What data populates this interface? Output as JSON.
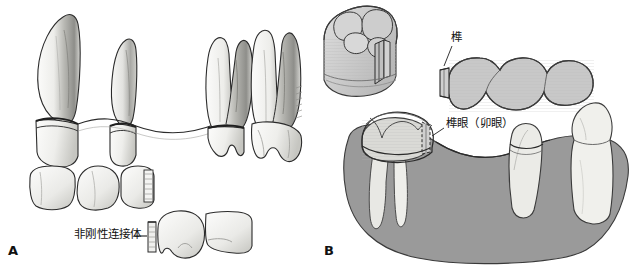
{
  "figure": {
    "background_color": "#ffffff",
    "width": 637,
    "height": 268
  },
  "colors": {
    "outline": "#2b2b2b",
    "tooth_light": "#f2f2ef",
    "tooth_mid": "#d8d8d4",
    "tooth_shade": "#b4b4b0",
    "crown_fill": "#c8c8c8",
    "mandible_gray": "#9a9a9a",
    "mandible_dark": "#8b8b8b",
    "hatch": "#a8a8a8",
    "label_text": "#111111"
  },
  "panel_a": {
    "letter": "A",
    "label_nonrigid": "非刚性连接体",
    "leader_dash": "—",
    "description": "Lateral view of prepared abutment teeth with a fixed partial denture, plus occlusal views of the retainers showing the non-rigid connector keyway",
    "teeth_lateral": [
      {
        "name": "canine-abutment",
        "root_type": "single",
        "prepared": true
      },
      {
        "name": "premolar-abutment",
        "root_type": "single",
        "prepared": true
      },
      {
        "name": "first-molar-abutment",
        "root_type": "multi",
        "prepared": true
      },
      {
        "name": "second-molar",
        "root_type": "multi",
        "prepared": false
      }
    ],
    "crowns_occlusal_upper": [
      {
        "name": "crown-unit-1",
        "has_keyway": false
      },
      {
        "name": "crown-unit-2",
        "has_keyway": false
      },
      {
        "name": "crown-unit-3",
        "has_keyway": true
      }
    ],
    "crowns_occlusal_lower": [
      {
        "name": "crown-unit-4",
        "has_key": true
      },
      {
        "name": "crown-unit-5",
        "has_key": false
      }
    ]
  },
  "panel_b": {
    "letter": "B",
    "label_tenon": "榫",
    "label_mortise": "榫眼（卯眼）",
    "description": "Mandibular arch with a three-unit bridge separated from the molar retainer; the tenon on the bridge seats into the mortise prepared in the molar crown",
    "inset": {
      "name": "molar-crown-inset",
      "description": "Enlarged three-quarter view of the molar retainer showing the box-form mortise slot on its distal surface"
    },
    "bridge_units": [
      {
        "name": "bridge-pontic-distal"
      },
      {
        "name": "bridge-pontic-middle"
      },
      {
        "name": "bridge-retainer-mesial"
      }
    ],
    "abutments": [
      {
        "name": "molar-abutment-crowned",
        "roots": 2,
        "crowned": true
      },
      {
        "name": "premolar-abutment-prepared",
        "roots": 1,
        "crowned": false
      },
      {
        "name": "canine-abutment-intact",
        "roots": 1,
        "crowned": false
      }
    ]
  }
}
